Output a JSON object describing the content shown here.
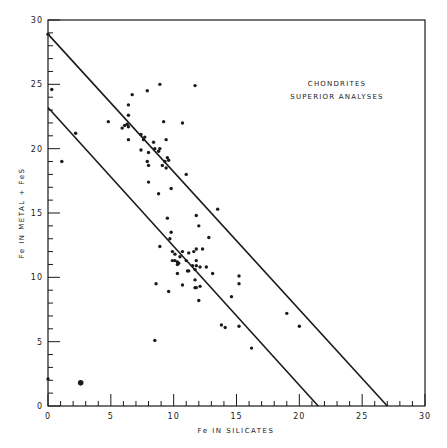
{
  "chart_data": {
    "type": "scatter",
    "title": "",
    "annotation": [
      "CHONDRITES",
      "SUPERIOR ANALYSES"
    ],
    "xlabel": "Fe IN SILICATES",
    "ylabel": "Fe IN METAL + FeS",
    "xlim": [
      0,
      30
    ],
    "ylim": [
      0,
      30
    ],
    "x_ticks": [
      0,
      5,
      10,
      15,
      20,
      25,
      30
    ],
    "y_ticks": [
      0,
      5,
      10,
      15,
      20,
      25,
      30
    ],
    "grid": false,
    "legend": null,
    "lines": [
      {
        "name": "upper-boundary",
        "x": [
          0,
          27.0
        ],
        "y": [
          28.9,
          0
        ]
      },
      {
        "name": "lower-boundary",
        "x": [
          0,
          21.5
        ],
        "y": [
          23.2,
          0
        ]
      }
    ],
    "series": [
      {
        "name": "chondrites",
        "points": [
          [
            0.3,
            24.6
          ],
          [
            1.1,
            19.0
          ],
          [
            2.2,
            21.2
          ],
          [
            4.8,
            22.1
          ],
          [
            5.9,
            21.6
          ],
          [
            6.1,
            21.8
          ],
          [
            6.3,
            21.9
          ],
          [
            6.4,
            21.7
          ],
          [
            6.4,
            22.6
          ],
          [
            6.4,
            23.4
          ],
          [
            6.7,
            24.2
          ],
          [
            7.9,
            24.5
          ],
          [
            8.9,
            25.0
          ],
          [
            11.7,
            24.9
          ],
          [
            6.4,
            20.7
          ],
          [
            7.4,
            21.1
          ],
          [
            7.7,
            20.9
          ],
          [
            7.6,
            20.7
          ],
          [
            9.2,
            22.1
          ],
          [
            10.7,
            22.0
          ],
          [
            9.4,
            20.7
          ],
          [
            8.4,
            20.5
          ],
          [
            8.5,
            20.0
          ],
          [
            8.9,
            20.0
          ],
          [
            8.8,
            19.8
          ],
          [
            7.4,
            19.9
          ],
          [
            8.0,
            19.7
          ],
          [
            9.5,
            19.3
          ],
          [
            9.6,
            19.1
          ],
          [
            7.9,
            19.0
          ],
          [
            9.3,
            19.0
          ],
          [
            8.0,
            18.7
          ],
          [
            9.1,
            18.7
          ],
          [
            9.4,
            18.5
          ],
          [
            11.0,
            18.0
          ],
          [
            8.0,
            17.4
          ],
          [
            9.8,
            16.9
          ],
          [
            8.8,
            16.5
          ],
          [
            11.8,
            14.8
          ],
          [
            9.5,
            14.6
          ],
          [
            13.5,
            15.3
          ],
          [
            12.0,
            14.0
          ],
          [
            9.8,
            13.5
          ],
          [
            9.7,
            13.0
          ],
          [
            12.8,
            13.1
          ],
          [
            8.9,
            12.4
          ],
          [
            11.8,
            12.2
          ],
          [
            12.3,
            12.2
          ],
          [
            10.7,
            12.0
          ],
          [
            9.9,
            12.0
          ],
          [
            11.2,
            11.9
          ],
          [
            11.6,
            12.0
          ],
          [
            10.1,
            11.8
          ],
          [
            10.5,
            11.6
          ],
          [
            10.1,
            11.3
          ],
          [
            9.9,
            11.3
          ],
          [
            10.3,
            11.2
          ],
          [
            10.4,
            11.1
          ],
          [
            11.0,
            11.3
          ],
          [
            11.8,
            11.3
          ],
          [
            11.8,
            10.9
          ],
          [
            12.1,
            10.8
          ],
          [
            12.6,
            10.8
          ],
          [
            11.5,
            10.9
          ],
          [
            10.3,
            11.0
          ],
          [
            11.1,
            10.5
          ],
          [
            11.2,
            10.5
          ],
          [
            11.7,
            10.6
          ],
          [
            13.1,
            10.3
          ],
          [
            10.3,
            10.3
          ],
          [
            15.2,
            10.1
          ],
          [
            11.7,
            9.8
          ],
          [
            8.6,
            9.5
          ],
          [
            10.7,
            9.4
          ],
          [
            15.2,
            9.5
          ],
          [
            11.7,
            9.2
          ],
          [
            12.1,
            9.3
          ],
          [
            11.8,
            9.2
          ],
          [
            9.6,
            8.9
          ],
          [
            14.6,
            8.5
          ],
          [
            12.0,
            8.2
          ],
          [
            19.0,
            7.2
          ],
          [
            13.8,
            6.3
          ],
          [
            14.1,
            6.1
          ],
          [
            15.2,
            6.2
          ],
          [
            20.0,
            6.2
          ],
          [
            16.2,
            4.5
          ],
          [
            8.5,
            5.1
          ],
          [
            0.0,
            2.1
          ],
          [
            0.0,
            28.9
          ]
        ]
      },
      {
        "name": "double-marker",
        "points": [
          [
            2.6,
            1.8
          ]
        ]
      }
    ],
    "colors": {
      "ink": "#1a1a1a",
      "background": "#ffffff"
    }
  }
}
